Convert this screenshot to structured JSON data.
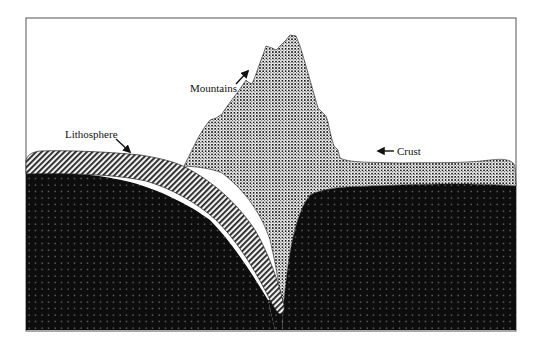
{
  "diagram": {
    "type": "cross-section",
    "labels": {
      "mountains": "Mountains",
      "lithosphere": "Lithosphere",
      "crust": "Crust"
    },
    "colors": {
      "background": "#ffffff",
      "frame": "#555555",
      "mantle": "#0d0d0d",
      "mantle_dots": "#9a9a9a",
      "crust_dark": "#1a1a1a",
      "crust_light": "#f0f0f0",
      "lithosphere_stripe": "#222222",
      "lithosphere_bg": "#f2f2f2"
    },
    "layers": [
      {
        "name": "Mantle",
        "pattern": "dotted-black"
      },
      {
        "name": "Lithosphere (subducting slab)",
        "pattern": "diagonal-hatch"
      },
      {
        "name": "Crust (continental / mountains)",
        "pattern": "checker-stipple"
      }
    ]
  }
}
